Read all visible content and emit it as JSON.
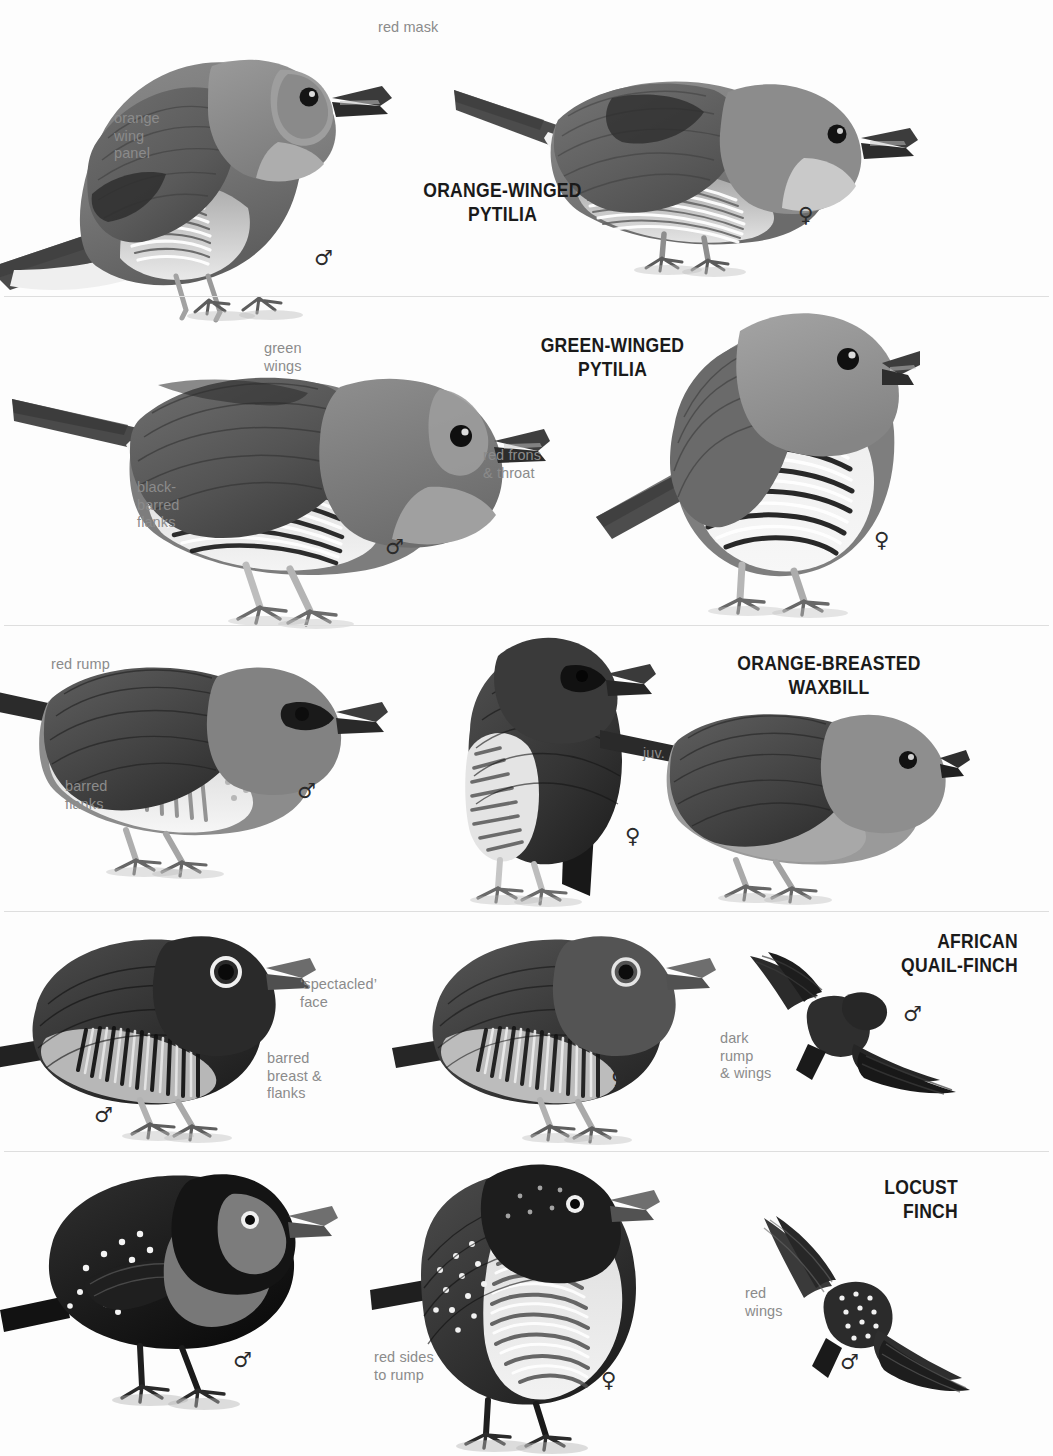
{
  "page": {
    "width": 1053,
    "height": 1456,
    "background": "#fdfdfd",
    "label_color": "#8b8b8b",
    "title_color": "#1a1a1a",
    "rule_color": "#dedede"
  },
  "symbols": {
    "male": "♂",
    "female": "♀"
  },
  "panels": [
    {
      "id": "orange-winged-pytilia",
      "title": "ORANGE-WINGED\nPYTILIA",
      "title_align": "center",
      "rule_y": 297,
      "labels": [
        {
          "name": "red-mask",
          "text": "red mask"
        },
        {
          "name": "orange-wing-panel",
          "text": "orange\nwing\npanel"
        }
      ],
      "figures": [
        {
          "name": "male-perched",
          "sex": "♂"
        },
        {
          "name": "female-perched",
          "sex": "♀"
        }
      ]
    },
    {
      "id": "green-winged-pytilia",
      "title": "GREEN-WINGED\nPYTILIA",
      "title_align": "center",
      "rule_y": 626,
      "labels": [
        {
          "name": "green-wings",
          "text": "green\nwings"
        },
        {
          "name": "black-barred-flanks",
          "text": "black-\nbarred\nflanks"
        },
        {
          "name": "red-frons-and-throat",
          "text": "red frons\n& throat"
        }
      ],
      "figures": [
        {
          "name": "male-perched",
          "sex": "♂"
        },
        {
          "name": "female-perched",
          "sex": "♀"
        }
      ]
    },
    {
      "id": "orange-breasted-waxbill",
      "title": "ORANGE-BREASTED\nWAXBILL",
      "title_align": "center",
      "rule_y": 912,
      "labels": [
        {
          "name": "red-rump",
          "text": "red rump"
        },
        {
          "name": "barred-flanks",
          "text": "barred\nflanks"
        },
        {
          "name": "juvenile",
          "text": "juv."
        }
      ],
      "figures": [
        {
          "name": "male-perched",
          "sex": "♂"
        },
        {
          "name": "female-perched",
          "sex": "♀"
        },
        {
          "name": "juvenile-perched",
          "sex": ""
        }
      ]
    },
    {
      "id": "african-quail-finch",
      "title": "AFRICAN\nQUAIL-FINCH",
      "title_align": "right",
      "rule_y": 1152,
      "labels": [
        {
          "name": "spectacled-face",
          "text": "‘spectacled’\nface"
        },
        {
          "name": "barred-breast-and-flanks",
          "text": "barred\nbreast &\nflanks"
        },
        {
          "name": "dark-rump-and-wings",
          "text": "dark\nrump\n& wings"
        }
      ],
      "figures": [
        {
          "name": "male-perched",
          "sex": "♂"
        },
        {
          "name": "female-perched",
          "sex": "♀"
        },
        {
          "name": "male-flight",
          "sex": "♂"
        }
      ]
    },
    {
      "id": "locust-finch",
      "title": "LOCUST\nFINCH",
      "title_align": "right",
      "rule_y": 1456,
      "labels": [
        {
          "name": "red-sides-to-rump",
          "text": "red sides\nto rump"
        },
        {
          "name": "red-wings",
          "text": "red\nwings"
        }
      ],
      "figures": [
        {
          "name": "male-perched",
          "sex": "♂"
        },
        {
          "name": "female-perched",
          "sex": "♀"
        },
        {
          "name": "male-flight",
          "sex": "♂"
        }
      ]
    }
  ]
}
